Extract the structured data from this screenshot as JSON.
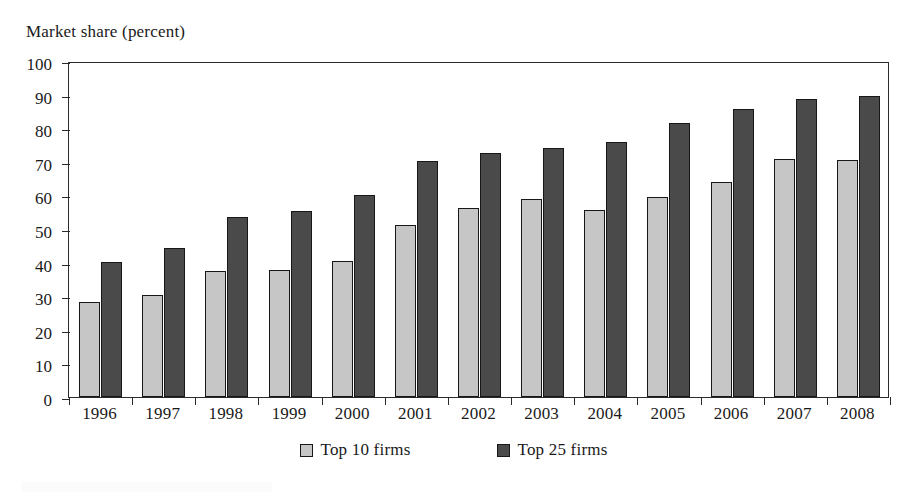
{
  "figure": {
    "background_color": "#ffffff",
    "faint_title": "",
    "axis_caption": "Market share (percent)"
  },
  "chart_data": {
    "type": "bar",
    "title": "",
    "subtitle": "",
    "xlabel": "",
    "ylabel": "Market share (percent)",
    "ylim": [
      0,
      100
    ],
    "yticks": [
      0,
      10,
      20,
      30,
      40,
      50,
      60,
      70,
      80,
      90,
      100
    ],
    "ytick_labels": [
      "0",
      "10",
      "20",
      "30",
      "40",
      "50",
      "60",
      "70",
      "80",
      "90",
      "100"
    ],
    "grid": false,
    "legend_position": "bottom-center",
    "categories": [
      "1996",
      "1997",
      "1998",
      "1999",
      "2000",
      "2001",
      "2002",
      "2003",
      "2004",
      "2005",
      "2006",
      "2007",
      "2008"
    ],
    "series": [
      {
        "name": "Top 10 firms",
        "color": "#c6c6c6",
        "edge_color": "#171717",
        "values": [
          28.2,
          30.3,
          37.4,
          37.7,
          40.6,
          51.1,
          56.3,
          59.0,
          55.6,
          59.6,
          64.0,
          70.7,
          70.4
        ]
      },
      {
        "name": "Top 25 firms",
        "color": "#4a4a4a",
        "edge_color": "#171717",
        "values": [
          40.2,
          44.3,
          53.5,
          55.5,
          60.1,
          70.2,
          72.6,
          74.0,
          75.8,
          81.7,
          85.7,
          88.7,
          89.7
        ]
      }
    ]
  },
  "legend": {
    "entries": [
      {
        "label": "Top 10 firms",
        "color": "#c6c6c6"
      },
      {
        "label": "Top 25 firms",
        "color": "#4a4a4a"
      }
    ]
  }
}
